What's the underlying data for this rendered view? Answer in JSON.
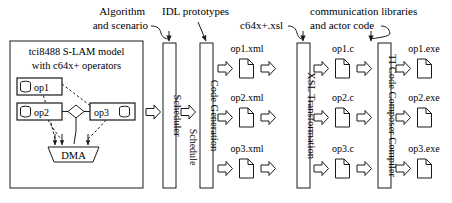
{
  "diagram": {
    "model_box": {
      "title_line1": "tci8488 S-LAM model",
      "title_line2": "with c64x+ operators",
      "nodes": [
        {
          "label": "op1",
          "icon": "database-cylinder-icon",
          "icon_side": "left"
        },
        {
          "label": "op2",
          "icon": "database-cylinder-icon",
          "icon_side": "left"
        },
        {
          "label": "op3",
          "icon": "database-cylinder-icon",
          "icon_side": "right"
        }
      ],
      "junction": {
        "shape": "diamond",
        "label": ""
      },
      "dma": {
        "label": "DMA",
        "shape": "trapezoid"
      }
    },
    "stages": [
      {
        "id": "scheduler",
        "label": "Scheduler"
      },
      {
        "id": "code-generation",
        "label": "Code Generation"
      },
      {
        "id": "xsl-transformation",
        "label": "XSL Transformation"
      },
      {
        "id": "ti-code-composer-compiler",
        "label": "TI Code Composer Compiler"
      }
    ],
    "annotations": [
      {
        "id": "algorithm-and-scenario",
        "line1": "Algorithm",
        "line2": "and scenario",
        "target": "scheduler"
      },
      {
        "id": "idl-prototypes",
        "line1": "IDL prototypes",
        "line2": "",
        "target": "code-generation"
      },
      {
        "id": "c64x-xsl",
        "line1": "c64x+.xsl",
        "line2": "",
        "target": "xsl-transformation"
      },
      {
        "id": "communication-libraries",
        "line1": "communication libraries",
        "line2": "and actor code",
        "target": "ti-code-composer-compiler"
      }
    ],
    "inter_stage_label": "Schedule",
    "artifact_rows": [
      {
        "xml": "op1.xml",
        "c": "op1.c",
        "exe": "op1.exe"
      },
      {
        "xml": "op2.xml",
        "c": "op2.c",
        "exe": "op2.exe"
      },
      {
        "xml": "op3.xml",
        "c": "op3.c",
        "exe": "op3.exe"
      }
    ],
    "colors": {
      "stroke": "#1a1a1a",
      "background": "#ffffff",
      "node_fill": "#ffffff"
    }
  }
}
